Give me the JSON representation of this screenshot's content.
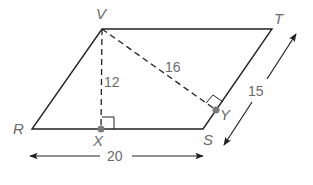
{
  "figure": {
    "type": "parallelogram",
    "vertices": {
      "V": {
        "label": "V",
        "x": 102,
        "y": 29
      },
      "T": {
        "label": "T",
        "x": 272,
        "y": 29
      },
      "S": {
        "label": "S",
        "x": 203,
        "y": 129
      },
      "R": {
        "label": "R",
        "x": 32,
        "y": 129
      }
    },
    "feet": {
      "X": {
        "label": "X",
        "x": 101,
        "y": 129
      },
      "Y": {
        "label": "Y",
        "x": 216,
        "y": 110
      }
    },
    "measures": {
      "height_VX": "12",
      "height_VY": "16",
      "base_RS": "20",
      "side_ST": "15"
    },
    "colors": {
      "line": "#222222",
      "label": "#6b6b6b",
      "point": "#7a7a7a"
    }
  }
}
